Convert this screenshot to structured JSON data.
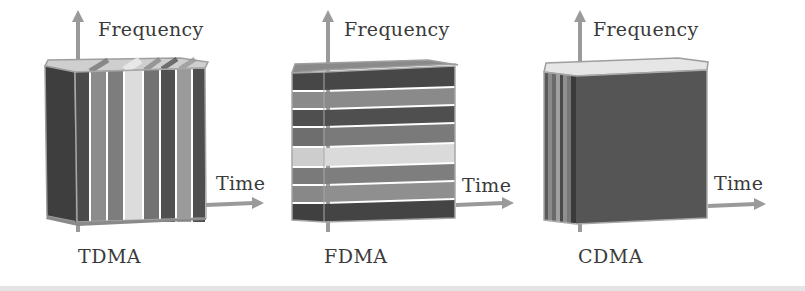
{
  "diagram": {
    "panels": [
      {
        "id": "tdma",
        "caption": "TDMA",
        "y_axis_label": "Frequency",
        "x_axis_label": "Time",
        "partition": "vertical stripes (time slots)",
        "stripe_colors": [
          "#4a4a4a",
          "#8c8c8c",
          "#7d7d7d",
          "#dcdcdc",
          "#727272",
          "#505050",
          "#9a9a9a",
          "#4e4e4e"
        ]
      },
      {
        "id": "fdma",
        "caption": "FDMA",
        "y_axis_label": "Frequency",
        "x_axis_label": "Time",
        "partition": "horizontal bands (frequency channels)",
        "band_colors": [
          "#474747",
          "#8a8a8a",
          "#4f4f4f",
          "#7a7a7a",
          "#dadada",
          "#7e7e7e",
          "#8f8f8f",
          "#444444"
        ]
      },
      {
        "id": "cdma",
        "caption": "CDMA",
        "y_axis_label": "Frequency",
        "x_axis_label": "Time",
        "partition": "stacked code layers (depth)",
        "front_color": "#555555",
        "side_stripe_colors": [
          "#5a5a5a",
          "#8a8a8a",
          "#6a6a6a",
          "#a0a0a0",
          "#4a4a4a",
          "#909090",
          "#777777",
          "#3a3a3a"
        ]
      }
    ],
    "colors": {
      "axis_arrow": "#9a9a9a",
      "text": "#3a3a3a",
      "outline": "#9e9e9e"
    }
  }
}
